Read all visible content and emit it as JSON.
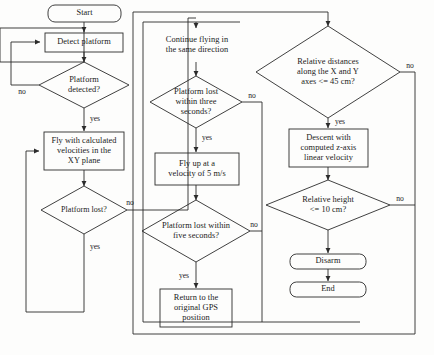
{
  "diagram": {
    "stroke_color": "#2b2b2b",
    "text_color": "#1a1a1a",
    "background_color": "#fdfdfc"
  },
  "nodes": {
    "start": {
      "label": "Start",
      "shape": "terminator"
    },
    "detect_platform": {
      "label": "Detect platform",
      "shape": "process"
    },
    "platform_detected": {
      "label": "Platform\ndetected?",
      "shape": "decision"
    },
    "fly_xy": {
      "label": "Fly with calculated\nvelocities in the\nXY plane",
      "shape": "process"
    },
    "platform_lost": {
      "label": "Platform lost?",
      "shape": "decision"
    },
    "continue_flying": {
      "label": "Continue flying in\nthe same direction",
      "shape": "process"
    },
    "lost_three_seconds": {
      "label": "Platform lost\nwithin three\nseconds?",
      "shape": "decision"
    },
    "fly_up": {
      "label": "Fly up at a\nvelocity of 5 m/s",
      "shape": "process"
    },
    "lost_five_seconds": {
      "label": "Platform lost within\nfive seconds?",
      "shape": "decision"
    },
    "return_gps": {
      "label": "Return to the\noriginal GPS\nposition",
      "shape": "process"
    },
    "relative_distances": {
      "label": "Relative distances\nalong the X and Y\naxes <= 45 cm?",
      "shape": "decision"
    },
    "descent": {
      "label": "Descent with\ncomputed z-axis\nlinear velocity",
      "shape": "process"
    },
    "relative_height": {
      "label": "Relative height\n<= 10 cm?",
      "shape": "decision"
    },
    "disarm": {
      "label": "Disarm",
      "shape": "terminator"
    },
    "end": {
      "label": "End",
      "shape": "terminator"
    }
  },
  "edge_labels": {
    "detected_no": "no",
    "detected_yes": "yes",
    "lost_no": "no",
    "lost_yes": "yes",
    "three_no": "no",
    "three_yes": "yes",
    "five_no": "no",
    "five_yes": "yes",
    "distances_no": "no",
    "distances_yes": "yes",
    "height_no": "no"
  }
}
